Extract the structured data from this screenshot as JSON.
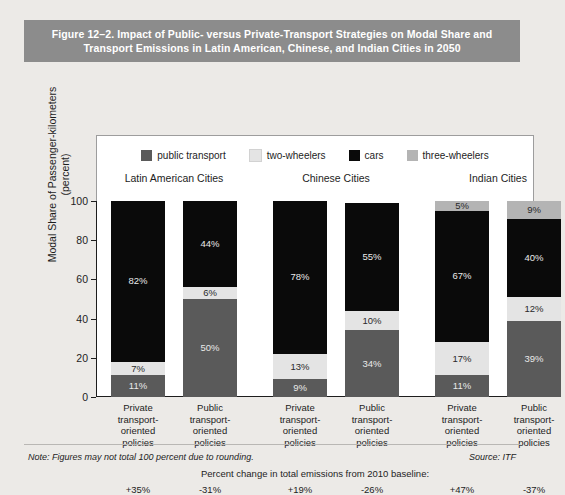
{
  "figure": {
    "title": "Figure 12–2. Impact of Public- versus Private-Transport Strategies on Modal Share and Transport Emissions in Latin American, Chinese, and Indian Cities in 2050",
    "title_line1": "Figure 12–2. Impact of Public- versus Private-Transport Strategies on Modal Share and",
    "title_line2": "Transport Emissions in Latin American, Chinese, and Indian Cities in 2050",
    "note": "Note: Figures may not total 100 percent due to rounding.",
    "source": "Source: ITF",
    "emissions_header": "Percent change in total emissions from 2010 baseline:"
  },
  "colors": {
    "title_band": "#8c8c8c",
    "page_background": "#eceae7",
    "panel_background": "#ffffff",
    "public_transport": "#5a5a5a",
    "two_wheelers": "#e4e4e4",
    "cars": "#0a0a0a",
    "three_wheelers": "#b4b4b4",
    "axis": "#1d1d1d"
  },
  "legend": {
    "items": [
      {
        "label": "public transport",
        "color": "#5a5a5a",
        "key": "public_transport"
      },
      {
        "label": "two-wheelers",
        "color": "#e4e4e4",
        "key": "two_wheelers"
      },
      {
        "label": "cars",
        "color": "#0a0a0a",
        "key": "cars"
      },
      {
        "label": "three-wheelers",
        "color": "#b4b4b4",
        "key": "three_wheelers"
      }
    ]
  },
  "chart_data": {
    "type": "bar",
    "subtype": "stacked-percentage",
    "title": "Impact of Public- versus Private-Transport Strategies on Modal Share and Transport Emissions in Latin American, Chinese, and Indian Cities in 2050",
    "xlabel": "",
    "ylabel": "Modal Share of Passenger-kilometers (percent)",
    "ylabel_line1": "Modal Share of Passenger-kilometers",
    "ylabel_line2": "(percent)",
    "ylim": [
      0,
      100
    ],
    "yticks": [
      0,
      20,
      40,
      60,
      80,
      100
    ],
    "ytick_labels": [
      "0",
      "20",
      "40",
      "60",
      "80",
      "100"
    ],
    "grid": false,
    "legend_position": "top",
    "group_labels": [
      "Latin American Cities",
      "Chinese Cities",
      "Indian Cities"
    ],
    "categories": [
      "Private transport-oriented policies",
      "Public transport-oriented policies",
      "Private transport-oriented policies",
      "Public transport-oriented policies",
      "Private transport-oriented policies",
      "Public transport-oriented policies"
    ],
    "category_lines": [
      [
        "Private",
        "transport-",
        "oriented",
        "policies"
      ],
      [
        "Public",
        "transport-",
        "oriented",
        "policies"
      ],
      [
        "Private",
        "transport-",
        "oriented",
        "policies"
      ],
      [
        "Public",
        "transport-",
        "oriented",
        "policies"
      ],
      [
        "Private",
        "transport-",
        "oriented",
        "policies"
      ],
      [
        "Public",
        "transport-",
        "oriented",
        "policies"
      ]
    ],
    "series": [
      {
        "name": "public transport",
        "color": "#5a5a5a",
        "values": [
          11,
          50,
          9,
          34,
          11,
          39
        ]
      },
      {
        "name": "two-wheelers",
        "color": "#e4e4e4",
        "values": [
          7,
          6,
          13,
          10,
          17,
          12
        ]
      },
      {
        "name": "cars",
        "color": "#0a0a0a",
        "values": [
          82,
          44,
          78,
          55,
          67,
          40
        ]
      },
      {
        "name": "three-wheelers",
        "color": "#b4b4b4",
        "values": [
          0,
          0,
          0,
          0,
          5,
          9
        ]
      }
    ],
    "bars": [
      {
        "group": "Latin American Cities",
        "policy": "Private transport-oriented policies",
        "segments": [
          {
            "name": "public transport",
            "value": 11,
            "label": "11%"
          },
          {
            "name": "two-wheelers",
            "value": 7,
            "label": "7%"
          },
          {
            "name": "cars",
            "value": 82,
            "label": "82%"
          },
          {
            "name": "three-wheelers",
            "value": 0,
            "label": ""
          }
        ],
        "emissions_change": "+35%"
      },
      {
        "group": "Latin American Cities",
        "policy": "Public transport-oriented policies",
        "segments": [
          {
            "name": "public transport",
            "value": 50,
            "label": "50%"
          },
          {
            "name": "two-wheelers",
            "value": 6,
            "label": "6%"
          },
          {
            "name": "cars",
            "value": 44,
            "label": "44%"
          },
          {
            "name": "three-wheelers",
            "value": 0,
            "label": ""
          }
        ],
        "emissions_change": "-31%"
      },
      {
        "group": "Chinese Cities",
        "policy": "Private transport-oriented policies",
        "segments": [
          {
            "name": "public transport",
            "value": 9,
            "label": "9%"
          },
          {
            "name": "two-wheelers",
            "value": 13,
            "label": "13%"
          },
          {
            "name": "cars",
            "value": 78,
            "label": "78%"
          },
          {
            "name": "three-wheelers",
            "value": 0,
            "label": ""
          }
        ],
        "emissions_change": "+19%"
      },
      {
        "group": "Chinese Cities",
        "policy": "Public transport-oriented policies",
        "segments": [
          {
            "name": "public transport",
            "value": 34,
            "label": "34%"
          },
          {
            "name": "two-wheelers",
            "value": 10,
            "label": "10%"
          },
          {
            "name": "cars",
            "value": 55,
            "label": "55%"
          },
          {
            "name": "three-wheelers",
            "value": 0,
            "label": ""
          }
        ],
        "emissions_change": "-26%"
      },
      {
        "group": "Indian Cities",
        "policy": "Private transport-oriented policies",
        "segments": [
          {
            "name": "public transport",
            "value": 11,
            "label": "11%"
          },
          {
            "name": "two-wheelers",
            "value": 17,
            "label": "17%"
          },
          {
            "name": "cars",
            "value": 67,
            "label": "67%"
          },
          {
            "name": "three-wheelers",
            "value": 5,
            "label": "5%"
          }
        ],
        "emissions_change": "+47%"
      },
      {
        "group": "Indian Cities",
        "policy": "Public transport-oriented policies",
        "segments": [
          {
            "name": "public transport",
            "value": 39,
            "label": "39%"
          },
          {
            "name": "two-wheelers",
            "value": 12,
            "label": "12%"
          },
          {
            "name": "cars",
            "value": 40,
            "label": "40%"
          },
          {
            "name": "three-wheelers",
            "value": 9,
            "label": "9%"
          }
        ],
        "emissions_change": "-37%"
      }
    ],
    "emissions_values": [
      "+35%",
      "-31%",
      "+19%",
      "-26%",
      "+47%",
      "-37%"
    ]
  }
}
